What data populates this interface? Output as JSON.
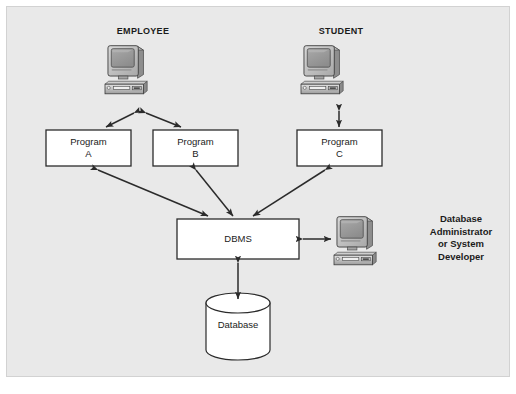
{
  "diagram": {
    "background_color": "#e9e9e9",
    "panel_border_color": "#d2d2d2",
    "stroke_color": "#2b2b2b",
    "box_fill": "#ffffff"
  },
  "actors": [
    {
      "id": "employee",
      "label": "EMPLOYEE",
      "icon": "desktop-computer-icon"
    },
    {
      "id": "student",
      "label": "STUDENT",
      "icon": "desktop-computer-icon"
    }
  ],
  "programs": [
    {
      "id": "program-a",
      "label": "Program\nA"
    },
    {
      "id": "program-b",
      "label": "Program\nB"
    },
    {
      "id": "program-c",
      "label": "Program\nC"
    }
  ],
  "dbms": {
    "label": "DBMS"
  },
  "database": {
    "label": "Database",
    "shape": "cylinder"
  },
  "admin": {
    "label": "Database\nAdministrator\nor System\nDeveloper",
    "icon": "desktop-computer-icon"
  },
  "connectors": [
    {
      "from": "employee",
      "to": "program-a",
      "arrow": "double"
    },
    {
      "from": "employee",
      "to": "program-b",
      "arrow": "double"
    },
    {
      "from": "student",
      "to": "program-c",
      "arrow": "double"
    },
    {
      "from": "program-a",
      "to": "dbms",
      "arrow": "double"
    },
    {
      "from": "program-b",
      "to": "dbms",
      "arrow": "double"
    },
    {
      "from": "program-c",
      "to": "dbms",
      "arrow": "double"
    },
    {
      "from": "dbms",
      "to": "admin",
      "arrow": "double"
    },
    {
      "from": "dbms",
      "to": "database",
      "arrow": "double"
    }
  ]
}
